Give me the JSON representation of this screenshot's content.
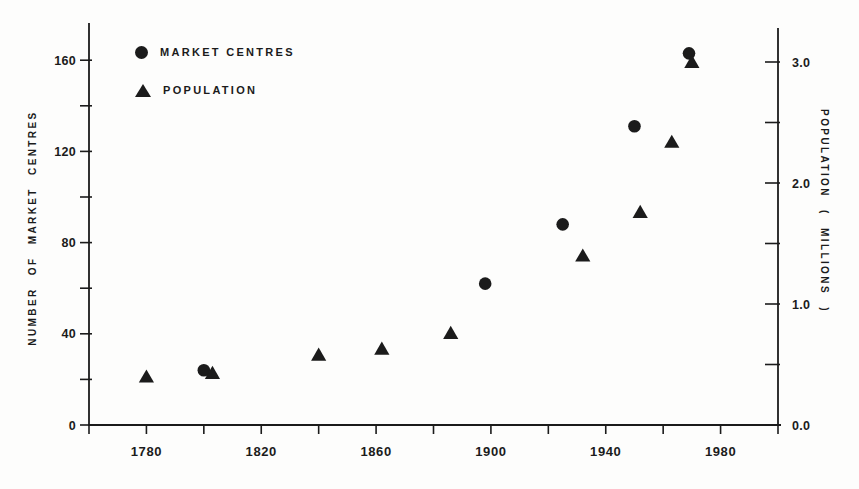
{
  "figure": {
    "background": "#fdfdfc",
    "ink_color": "#1b1b1b"
  },
  "chart_data": {
    "type": "scatter",
    "title": "",
    "grid": false,
    "legend_position": "top-left-inside",
    "legend": [
      {
        "marker": "circle",
        "label": "MARKET CENTRES"
      },
      {
        "marker": "triangle",
        "label": "POPULATION"
      }
    ],
    "x_axis": {
      "min": 1760,
      "max": 2000,
      "tick_step": 20,
      "tick_labels": [
        "1780",
        "1820",
        "1860",
        "1900",
        "1940",
        "1980"
      ]
    },
    "y_left": {
      "label": "NUMBER  OF  MARKET  CENTRES",
      "min": 0,
      "max": 160,
      "tick_step": 20,
      "tick_labels": [
        "0",
        "40",
        "80",
        "120",
        "160"
      ]
    },
    "y_right": {
      "label": "POPULATION  ( MILLIONS )",
      "min": 0,
      "max": 3.0,
      "tick_step": 0.5,
      "tick_labels": [
        "0.0",
        "1.0",
        "2.0",
        "3.0"
      ]
    },
    "series": [
      {
        "name": "Market Centres",
        "marker": "circle",
        "axis": "left",
        "points": [
          {
            "x": 1800,
            "y": 24
          },
          {
            "x": 1898,
            "y": 62
          },
          {
            "x": 1925,
            "y": 88
          },
          {
            "x": 1950,
            "y": 131
          },
          {
            "x": 1969,
            "y": 163
          }
        ]
      },
      {
        "name": "Population",
        "marker": "triangle",
        "axis": "right",
        "points": [
          {
            "x": 1780,
            "y": 0.4
          },
          {
            "x": 1803,
            "y": 0.43
          },
          {
            "x": 1840,
            "y": 0.58
          },
          {
            "x": 1862,
            "y": 0.63
          },
          {
            "x": 1886,
            "y": 0.76
          },
          {
            "x": 1932,
            "y": 1.4
          },
          {
            "x": 1952,
            "y": 1.76
          },
          {
            "x": 1963,
            "y": 2.34
          },
          {
            "x": 1970,
            "y": 3.0
          }
        ]
      }
    ]
  }
}
